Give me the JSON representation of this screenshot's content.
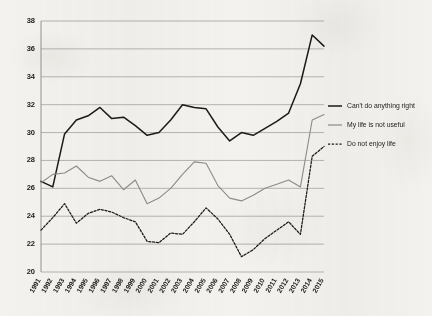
{
  "chart_data": {
    "type": "line",
    "title": "",
    "subtitle": "",
    "xlabel": "",
    "ylabel": "",
    "ylim": [
      20,
      38
    ],
    "ytick_step": 2,
    "yticks": [
      20,
      22,
      24,
      26,
      28,
      30,
      32,
      34,
      36,
      38
    ],
    "grid": true,
    "grid_axis": "y",
    "legend_position": "right",
    "categories": [
      "1991",
      "1992",
      "1993",
      "1994",
      "1995",
      "1996",
      "1997",
      "1998",
      "1999",
      "2000",
      "2001",
      "2002",
      "2003",
      "2004",
      "2005",
      "2006",
      "2007",
      "2008",
      "2009",
      "2010",
      "2011",
      "2012",
      "2013",
      "2014",
      "2015"
    ],
    "series": [
      {
        "name": "Can't do anything right",
        "color": "#1a1a1a",
        "style": "solid",
        "width": 1.5,
        "values": [
          26.5,
          26.1,
          29.9,
          30.9,
          31.2,
          31.8,
          31.0,
          31.1,
          30.5,
          29.8,
          30.0,
          30.9,
          32.0,
          31.8,
          31.7,
          30.4,
          29.4,
          30.0,
          29.8,
          30.3,
          30.8,
          31.4,
          33.5,
          37.0,
          36.2
        ]
      },
      {
        "name": "My life is not useful",
        "color": "#8c8c8c",
        "style": "solid",
        "width": 1.1,
        "values": [
          26.4,
          27.0,
          27.1,
          27.6,
          26.8,
          26.5,
          26.9,
          25.9,
          26.6,
          24.9,
          25.3,
          26.0,
          27.0,
          27.9,
          27.8,
          26.2,
          25.3,
          25.1,
          25.5,
          26.0,
          26.3,
          26.6,
          26.1,
          30.9,
          31.3
        ]
      },
      {
        "name": "Do not enjoy life",
        "color": "#1a1a1a",
        "style": "dotted",
        "width": 1.25,
        "values": [
          23.0,
          23.9,
          24.9,
          23.5,
          24.2,
          24.5,
          24.3,
          23.9,
          23.6,
          22.2,
          22.1,
          22.8,
          22.7,
          23.6,
          24.6,
          23.8,
          22.7,
          21.1,
          21.6,
          22.4,
          23.0,
          23.6,
          22.7,
          28.3,
          29.0
        ]
      }
    ]
  },
  "legend": {
    "items": [
      {
        "label": "Can't do anything right"
      },
      {
        "label": "My life is not useful"
      },
      {
        "label": "Do not enjoy life"
      }
    ]
  }
}
